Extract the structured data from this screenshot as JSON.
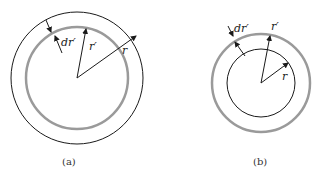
{
  "figure": {
    "panels": [
      {
        "id": "a",
        "caption": "(a)",
        "labels": {
          "dr": "dr′",
          "rprime": "r′",
          "r": "r"
        },
        "description": "Thin shell of radius r′ (gray) lies inside the point at radius r (black outer circle)"
      },
      {
        "id": "b",
        "caption": "(b)",
        "labels": {
          "dr": "dr′",
          "rprime": "r′",
          "r": "r"
        },
        "description": "Thin shell of radius r′ (gray) lies outside the point at radius r (black inner circle)"
      }
    ],
    "colors": {
      "black_circle": "#1a1a1a",
      "shell_gray": "#9a9a9a",
      "arrow": "#1a1a1a"
    }
  }
}
